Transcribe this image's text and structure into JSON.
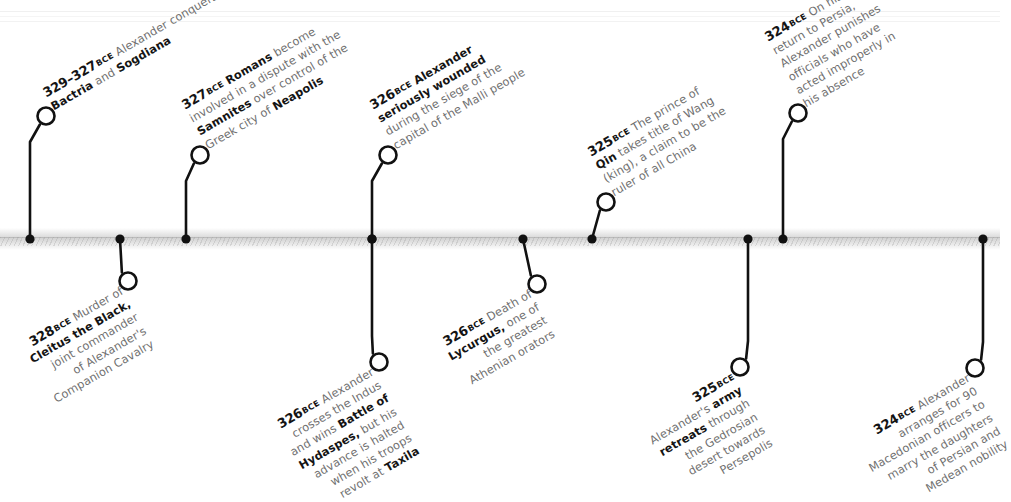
{
  "chart_data": {
    "type": "timeline",
    "title": "",
    "orientation": "horizontal",
    "era_label": "BCE",
    "axis": {
      "y": 239,
      "x_start": 0,
      "x_end": 1000,
      "direction": "earlier-to-later"
    },
    "events": [
      {
        "id": "e1",
        "year_label": "329–327",
        "era": "BCE",
        "side": "above",
        "dot_x": 30,
        "node_x": 46,
        "node_y": 116,
        "lines": [
          [
            {
              "t": "Alexander conquers",
              "b": false
            }
          ],
          [
            {
              "t": "Bactria",
              "b": true
            },
            {
              "t": " and ",
              "b": false
            },
            {
              "t": "Sogdiana",
              "b": true
            }
          ]
        ],
        "plain_text": "329–327 BCE Alexander conquers Bactria and Sogdiana"
      },
      {
        "id": "e2",
        "year_label": "328",
        "era": "BCE",
        "side": "below",
        "dot_x": 120,
        "node_x": 128,
        "node_y": 281,
        "lines": [
          [
            {
              "t": "Murder of",
              "b": false
            }
          ],
          [
            {
              "t": "Cleitus the Black,",
              "b": true
            }
          ],
          [
            {
              "t": "joint commander",
              "b": false
            }
          ],
          [
            {
              "t": "of Alexander's",
              "b": false
            }
          ],
          [
            {
              "t": "Companion Cavalry",
              "b": false
            }
          ]
        ],
        "plain_text": "328 BCE Murder of Cleitus the Black, joint commander of Alexander's Companion Cavalry"
      },
      {
        "id": "e3",
        "year_label": "327",
        "era": "BCE",
        "side": "above",
        "dot_x": 186,
        "node_x": 200,
        "node_y": 155,
        "lines": [
          [
            {
              "t": "Romans",
              "b": true
            },
            {
              "t": " become",
              "b": false
            }
          ],
          [
            {
              "t": "involved in a dispute with the",
              "b": false
            }
          ],
          [
            {
              "t": "Samnites",
              "b": true
            },
            {
              "t": " over control of the",
              "b": false
            }
          ],
          [
            {
              "t": "Greek city of ",
              "b": false
            },
            {
              "t": "Neapolis",
              "b": true
            }
          ]
        ],
        "plain_text": "327 BCE Romans become involved in a dispute with the Samnites over control of the Greek city of Neapolis"
      },
      {
        "id": "e4",
        "year_label": "326",
        "era": "BCE",
        "side": "below",
        "dot_x": 372,
        "node_x": 379,
        "node_y": 362,
        "lines": [
          [
            {
              "t": "Alexander",
              "b": false
            }
          ],
          [
            {
              "t": "crosses the Indus",
              "b": false
            }
          ],
          [
            {
              "t": "and wins ",
              "b": false
            },
            {
              "t": "Battle of",
              "b": true
            }
          ],
          [
            {
              "t": "Hydaspes,",
              "b": true
            },
            {
              "t": " but his",
              "b": false
            }
          ],
          [
            {
              "t": "advance is halted",
              "b": false
            }
          ],
          [
            {
              "t": "when his troops",
              "b": false
            }
          ],
          [
            {
              "t": "revolt at ",
              "b": false
            },
            {
              "t": "Taxila",
              "b": true
            }
          ]
        ],
        "plain_text": "326 BCE Alexander crosses the Indus and wins Battle of Hydaspes, but his advance is halted when his troops revolt at Taxila"
      },
      {
        "id": "e5",
        "year_label": "326",
        "era": "BCE",
        "side": "above",
        "dot_x": 372,
        "node_x": 388,
        "node_y": 155,
        "lines": [
          [
            {
              "t": "Alexander",
              "b": true
            }
          ],
          [
            {
              "t": "seriously wounded",
              "b": true
            }
          ],
          [
            {
              "t": "during the siege of the",
              "b": false
            }
          ],
          [
            {
              "t": "capital of the Malli people",
              "b": false
            }
          ]
        ],
        "plain_text": "326 BCE Alexander seriously wounded during the siege of the capital of the Malli people"
      },
      {
        "id": "e6",
        "year_label": "326",
        "era": "BCE",
        "side": "below",
        "dot_x": 523,
        "node_x": 537,
        "node_y": 284,
        "lines": [
          [
            {
              "t": "Death of",
              "b": false
            }
          ],
          [
            {
              "t": "Lycurgus,",
              "b": true
            },
            {
              "t": " one of",
              "b": false
            }
          ],
          [
            {
              "t": "the greatest",
              "b": false
            }
          ],
          [
            {
              "t": "Athenian orators",
              "b": false
            }
          ]
        ],
        "plain_text": "326 BCE Death of Lycurgus, one of the greatest Athenian orators"
      },
      {
        "id": "e7",
        "year_label": "325",
        "era": "BCE",
        "side": "above",
        "dot_x": 592,
        "node_x": 606,
        "node_y": 202,
        "lines": [
          [
            {
              "t": "The prince of",
              "b": false
            }
          ],
          [
            {
              "t": "Qin",
              "b": true
            },
            {
              "t": " takes title of Wang",
              "b": false
            }
          ],
          [
            {
              "t": "(king), a claim to be the",
              "b": false
            }
          ],
          [
            {
              "t": "ruler of all China",
              "b": false
            }
          ]
        ],
        "plain_text": "325 BCE The prince of Qin takes title of Wang (king), a claim to be the ruler of all China"
      },
      {
        "id": "e8",
        "year_label": "325",
        "era": "BCE",
        "side": "below",
        "dot_x": 748,
        "node_x": 740,
        "node_y": 367,
        "year_own_line": true,
        "lines": [
          [
            {
              "t": "Alexander's ",
              "b": false
            },
            {
              "t": "army",
              "b": true
            }
          ],
          [
            {
              "t": "retreats",
              "b": true
            },
            {
              "t": " through",
              "b": false
            }
          ],
          [
            {
              "t": "the Gedrosian",
              "b": false
            }
          ],
          [
            {
              "t": "desert towards",
              "b": false
            }
          ],
          [
            {
              "t": "Persepolis",
              "b": false
            }
          ]
        ],
        "plain_text": "325 BCE Alexander's army retreats through the Gedrosian desert towards Persepolis"
      },
      {
        "id": "e9",
        "year_label": "324",
        "era": "BCE",
        "side": "above",
        "dot_x": 783,
        "node_x": 798,
        "node_y": 113,
        "lines": [
          [
            {
              "t": "On his",
              "b": false
            }
          ],
          [
            {
              "t": "return to Persia,",
              "b": false
            }
          ],
          [
            {
              "t": "Alexander punishes",
              "b": false
            }
          ],
          [
            {
              "t": "officials who have",
              "b": false
            }
          ],
          [
            {
              "t": "acted improperly in",
              "b": false
            }
          ],
          [
            {
              "t": "his absence",
              "b": false
            }
          ]
        ],
        "plain_text": "324 BCE On his return to Persia, Alexander punishes officials who have acted improperly in his absence"
      },
      {
        "id": "e10",
        "year_label": "324",
        "era": "BCE",
        "side": "below",
        "dot_x": 983,
        "node_x": 975,
        "node_y": 368,
        "lines": [
          [
            {
              "t": "Alexander",
              "b": false
            }
          ],
          [
            {
              "t": "arranges for 90",
              "b": false
            }
          ],
          [
            {
              "t": "Macedonian officers to",
              "b": false
            }
          ],
          [
            {
              "t": "marry the daughters",
              "b": false
            }
          ],
          [
            {
              "t": "of Persian and",
              "b": false
            }
          ],
          [
            {
              "t": "Medean nobility",
              "b": false
            }
          ]
        ],
        "plain_text": "324 BCE Alexander arranges for 90 Macedonian officers to marry the daughters of Persian and Medean nobility"
      }
    ],
    "colors": {
      "text_regular": "#6f6f6f",
      "text_bold": "#141414",
      "connector": "#111111",
      "axis_band": "#d4d4d4",
      "background": "#ffffff"
    }
  }
}
